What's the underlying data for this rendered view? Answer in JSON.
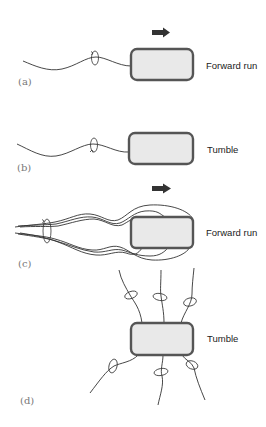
{
  "diagram": {
    "colors": {
      "cell_fill": "#e9e9e9",
      "cell_stroke": "#555555",
      "flagellum": "#333333",
      "arrow": "#333333"
    },
    "panels": [
      {
        "id": "a",
        "label": "(a)",
        "state": "Forward run",
        "motion_arrow": true,
        "flagella": "single-trailing"
      },
      {
        "id": "b",
        "label": "(b)",
        "state": "Tumble",
        "motion_arrow": false,
        "flagella": "single-trailing"
      },
      {
        "id": "c",
        "label": "(c)",
        "state": "Forward run",
        "motion_arrow": true,
        "flagella": "bundled"
      },
      {
        "id": "d",
        "label": "(d)",
        "state": "Tumble",
        "motion_arrow": false,
        "flagella": "peritrichous-splayed"
      }
    ]
  }
}
